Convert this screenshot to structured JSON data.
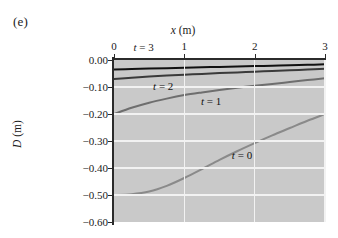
{
  "panel": {
    "letter": "(e)"
  },
  "axes": {
    "x": {
      "title_italic": "x",
      "title_unit": "(m)",
      "ticks": [
        "0",
        "1",
        "2",
        "3"
      ],
      "tick_values": [
        0,
        1,
        2,
        3
      ],
      "position": "top"
    },
    "y": {
      "title_italic": "D",
      "title_unit": "(m)",
      "ticks": [
        "0.00",
        "−0.10",
        "−0.20",
        "−0.30",
        "−0.40",
        "−0.50",
        "−0.60"
      ],
      "tick_values": [
        0.0,
        -0.1,
        -0.2,
        -0.3,
        -0.4,
        -0.5,
        -0.6
      ]
    }
  },
  "colors": {
    "plot_background": "#c9c9c9",
    "gridline": "#f2f2f2",
    "axis": "#2b2b2b",
    "curve_t3": "#111111",
    "curve_t2": "#3a3a3a",
    "curve_t1": "#6e6e6e",
    "curve_t0": "#8a8a8a",
    "page_background": "#ffffff"
  },
  "curve_labels": [
    {
      "id": "label-t3",
      "italic": "t",
      "text": " = 3",
      "x": 0.42,
      "y": 0.035
    },
    {
      "id": "label-t2",
      "italic": "t",
      "text": " = 2",
      "x": 0.7,
      "y": -0.097
    },
    {
      "id": "label-t1",
      "italic": "t",
      "text": " = 1",
      "x": 1.38,
      "y": -0.152
    },
    {
      "id": "label-t0",
      "italic": "t",
      "text": " = 0",
      "x": 1.82,
      "y": -0.352
    }
  ],
  "chart_data": {
    "type": "line",
    "title": "",
    "xlabel": "x (m)",
    "ylabel": "D (m)",
    "xlim": [
      0,
      3
    ],
    "ylim": [
      -0.6,
      0.0
    ],
    "xticks": [
      0,
      1,
      2,
      3
    ],
    "yticks": [
      0.0,
      -0.1,
      -0.2,
      -0.3,
      -0.4,
      -0.5,
      -0.6
    ],
    "grid": true,
    "legend": "inline-annotations",
    "series": [
      {
        "name": "t = 3",
        "color": "#111111",
        "width": 2.0,
        "x": [
          0.0,
          0.25,
          0.5,
          0.75,
          1.0,
          1.25,
          1.5,
          1.75,
          2.0,
          2.25,
          2.5,
          2.75,
          3.0
        ],
        "y": [
          -0.035,
          -0.0334,
          -0.0318,
          -0.0302,
          -0.0287,
          -0.0271,
          -0.0256,
          -0.0241,
          -0.0226,
          -0.0211,
          -0.0196,
          -0.0179,
          -0.016
        ]
      },
      {
        "name": "t = 2",
        "color": "#3a3a3a",
        "width": 2.0,
        "x": [
          0.0,
          0.25,
          0.5,
          0.75,
          1.0,
          1.25,
          1.5,
          1.75,
          2.0,
          2.25,
          2.5,
          2.75,
          3.0
        ],
        "y": [
          -0.07,
          -0.0655,
          -0.0615,
          -0.0578,
          -0.0545,
          -0.0514,
          -0.0486,
          -0.0459,
          -0.0433,
          -0.0407,
          -0.0381,
          -0.0354,
          -0.0325
        ]
      },
      {
        "name": "t = 1",
        "color": "#6e6e6e",
        "width": 2.0,
        "x": [
          0.0,
          0.25,
          0.5,
          0.75,
          1.0,
          1.25,
          1.5,
          1.75,
          2.0,
          2.25,
          2.5,
          2.75,
          3.0
        ],
        "y": [
          -0.2,
          -0.177,
          -0.158,
          -0.143,
          -0.13,
          -0.12,
          -0.111,
          -0.103,
          -0.0955,
          -0.0885,
          -0.0815,
          -0.0745,
          -0.068
        ]
      },
      {
        "name": "t = 0",
        "color": "#8a8a8a",
        "width": 2.0,
        "x": [
          0.0,
          0.25,
          0.5,
          0.75,
          1.0,
          1.25,
          1.5,
          1.75,
          2.0,
          2.25,
          2.5,
          2.75,
          3.0
        ],
        "y": [
          -0.5,
          -0.497,
          -0.487,
          -0.466,
          -0.437,
          -0.404,
          -0.37,
          -0.338,
          -0.308,
          -0.279,
          -0.252,
          -0.225,
          -0.2
        ]
      }
    ]
  }
}
